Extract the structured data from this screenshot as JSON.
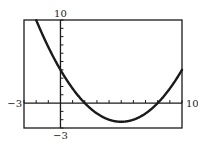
{
  "chart_data": {
    "type": "line",
    "title": "",
    "xlabel": "",
    "ylabel": "",
    "xlim": [
      -3,
      10
    ],
    "ylim": [
      -3,
      10
    ],
    "grid": false,
    "legend": null,
    "xscale_tick": 1,
    "yscale_tick": 1,
    "tick_labels": {
      "xmin": "−3",
      "xmax": "10",
      "ymin": "−3",
      "ymax": "10"
    },
    "function": "f(x) = 0.25x^2 - 2.5x + 4",
    "coefficients": {
      "a": 0.25,
      "b": -2.5,
      "c": 4
    },
    "features": {
      "y_intercept": 4,
      "roots": [
        2,
        8
      ],
      "vertex": [
        5,
        -2.25
      ]
    },
    "series": [
      {
        "name": "f(x)",
        "x": [
          -2,
          -1,
          0,
          1,
          2,
          3,
          4,
          5,
          6,
          7,
          8,
          9,
          10
        ],
        "y": [
          10,
          6.75,
          4,
          1.75,
          0,
          -1.25,
          -2,
          -2.25,
          -2,
          -1.25,
          0,
          1.75,
          4
        ]
      }
    ],
    "colors": {
      "curve": "#1a1a1a",
      "axes": "#1a1a1a",
      "background": "#ffffff"
    }
  }
}
